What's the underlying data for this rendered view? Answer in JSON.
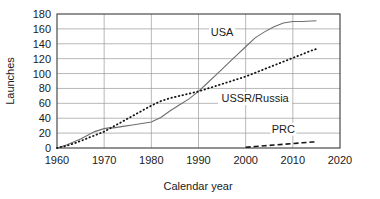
{
  "chart_data": {
    "type": "line",
    "title": "",
    "xlabel": "Calendar year",
    "ylabel": "Launches",
    "xlim": [
      1960,
      2020
    ],
    "ylim": [
      0,
      180
    ],
    "xticks": [
      1960,
      1970,
      1980,
      1990,
      2000,
      2010,
      2020
    ],
    "yticks": [
      0,
      20,
      40,
      60,
      80,
      100,
      120,
      140,
      160,
      180
    ],
    "grid": true,
    "legend_position": "inline-annotations",
    "series": [
      {
        "name": "USA",
        "style": "solid",
        "color": "#6e6e6e",
        "x": [
          1960,
          1962,
          1965,
          1968,
          1970,
          1971,
          1972,
          1974,
          1976,
          1978,
          1980,
          1982,
          1984,
          1986,
          1988,
          1990,
          1992,
          1994,
          1996,
          1998,
          2000,
          2002,
          2004,
          2006,
          2008,
          2010,
          2012,
          2015
        ],
        "y": [
          0,
          4,
          12,
          22,
          26,
          27,
          27,
          29,
          31,
          33,
          35,
          41,
          50,
          58,
          66,
          76,
          88,
          100,
          112,
          124,
          136,
          148,
          156,
          163,
          168,
          170,
          170,
          171
        ]
      },
      {
        "name": "USSR/Russia",
        "style": "dotted",
        "color": "#151515",
        "x": [
          1960,
          1962,
          1964,
          1966,
          1968,
          1970,
          1972,
          1974,
          1976,
          1978,
          1980,
          1982,
          1984,
          1986,
          1988,
          1990,
          1992,
          1994,
          1996,
          1998,
          2000,
          2002,
          2004,
          2006,
          2008,
          2010,
          2012,
          2014,
          2015
        ],
        "y": [
          0,
          3,
          7,
          12,
          17,
          22,
          29,
          36,
          43,
          50,
          57,
          63,
          67,
          70,
          73,
          76,
          80,
          84,
          88,
          92,
          96,
          101,
          106,
          111,
          116,
          121,
          126,
          131,
          133
        ]
      },
      {
        "name": "PRC",
        "style": "dashed",
        "color": "#151515",
        "x": [
          2000,
          2002,
          2004,
          2006,
          2008,
          2010,
          2012,
          2014,
          2015
        ],
        "y": [
          1,
          2,
          3,
          4,
          5,
          6,
          7,
          8,
          8
        ]
      }
    ],
    "annotations": [
      {
        "text": "USA",
        "x": 1995,
        "y": 152
      },
      {
        "text": "USSR/Russia",
        "x": 2002,
        "y": 63
      },
      {
        "text": "PRC",
        "x": 2008,
        "y": 22
      }
    ]
  }
}
